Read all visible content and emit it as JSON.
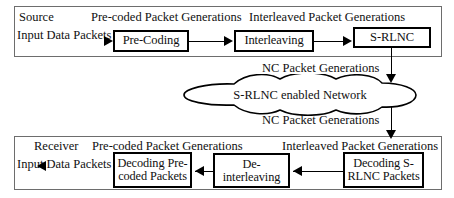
{
  "diagram": {
    "source_section": {
      "section_label": "Source",
      "input_label": "Input Data Packets",
      "annotation_precoded": "Pre-coded Packet Generations",
      "annotation_interleaved": "Interleaved Packet Generations",
      "boxes": [
        {
          "id": "pre-coding",
          "label": "Pre-Coding"
        },
        {
          "id": "interleaving",
          "label": "Interleaving"
        },
        {
          "id": "s-rlnc",
          "label": "S-RLNC"
        }
      ]
    },
    "network": {
      "label": "S-RLNC enabled Network",
      "annotation_top": "NC Packet Generations",
      "annotation_bottom": "NC Packet Generations"
    },
    "receiver_section": {
      "section_label": "Receiver",
      "input_label": "Input Data Packets",
      "annotation_precoded": "Pre-coded Packet Generations",
      "annotation_interleaved": "Interleaved Packet Generations",
      "boxes": [
        {
          "id": "decoding-pre-coded",
          "label": "Decoding Pre-coded Packets"
        },
        {
          "id": "de-interleaving",
          "label": "De-interleaving"
        },
        {
          "id": "decoding-s-rlnc",
          "label": "Decoding S-RLNC Packets"
        }
      ]
    },
    "colors": {
      "background": "#ffffff",
      "box_border": "#000000",
      "frame_border": "#6d6d6d",
      "text": "#101010",
      "connector": "#000000"
    }
  }
}
